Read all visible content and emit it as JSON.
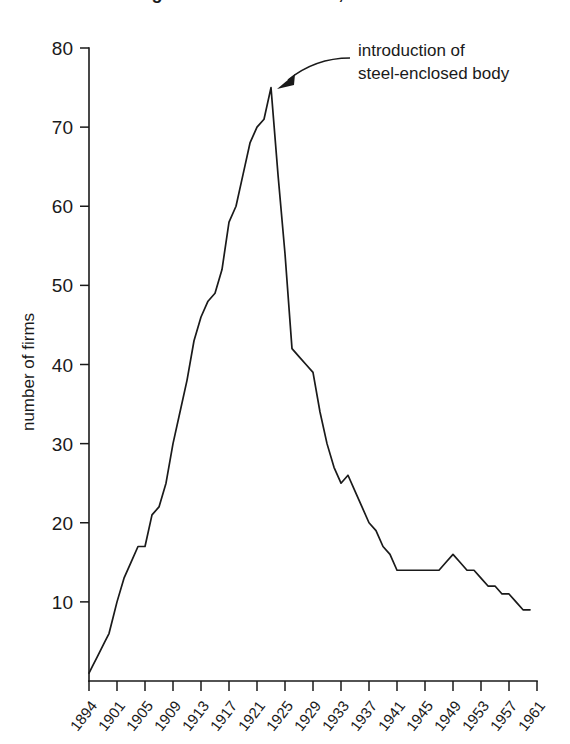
{
  "figure": {
    "title_partial": "Figure: number of firms, 1894-1961",
    "annotation_line1": "introduction of",
    "annotation_line2": "steel-enclosed body",
    "line_color": "#1a1a1a",
    "background_color": "#ffffff"
  },
  "chart_data": {
    "type": "line",
    "title": "",
    "xlabel": "",
    "ylabel": "number of firms",
    "xlim": [
      1894,
      1961
    ],
    "ylim": [
      0,
      80
    ],
    "grid": false,
    "legend": "none",
    "xtick_labels": [
      "1894",
      "1901",
      "1905",
      "1909",
      "1913",
      "1917",
      "1921",
      "1925",
      "1929",
      "1933",
      "1937",
      "1941",
      "1945",
      "1949",
      "1953",
      "1957",
      "1961"
    ],
    "ytick_labels": [
      "10",
      "20",
      "30",
      "40",
      "50",
      "60",
      "70",
      "80"
    ],
    "ytick_values": [
      10,
      20,
      30,
      40,
      50,
      60,
      70,
      80
    ],
    "annotations": [
      {
        "text": "introduction of steel-enclosed body",
        "target_x": 1923,
        "target_y": 75
      }
    ],
    "x": [
      1894,
      1895,
      1896,
      1897,
      1898,
      1899,
      1900,
      1901,
      1902,
      1903,
      1904,
      1905,
      1906,
      1907,
      1908,
      1909,
      1910,
      1911,
      1912,
      1913,
      1914,
      1915,
      1916,
      1917,
      1918,
      1919,
      1920,
      1921,
      1922,
      1923,
      1924,
      1925,
      1926,
      1927,
      1928,
      1929,
      1930,
      1931,
      1932,
      1933,
      1934,
      1935,
      1936,
      1937,
      1938,
      1939,
      1940,
      1941,
      1942,
      1943,
      1944,
      1945,
      1946,
      1947,
      1948,
      1949,
      1950,
      1951,
      1952,
      1953,
      1954,
      1955,
      1956,
      1957,
      1958,
      1959,
      1960
    ],
    "values": [
      1,
      2,
      3,
      4,
      5,
      6,
      8,
      10,
      13,
      15,
      17,
      17,
      21,
      22,
      25,
      30,
      34,
      38,
      43,
      46,
      48,
      49,
      52,
      58,
      60,
      64,
      68,
      70,
      71,
      75,
      64,
      54,
      42,
      41,
      40,
      39,
      34,
      30,
      27,
      25,
      26,
      24,
      22,
      20,
      19,
      17,
      16,
      14,
      14,
      14,
      14,
      14,
      14,
      14,
      15,
      16,
      15,
      14,
      14,
      13,
      12,
      12,
      11,
      11,
      10,
      9,
      9
    ]
  }
}
